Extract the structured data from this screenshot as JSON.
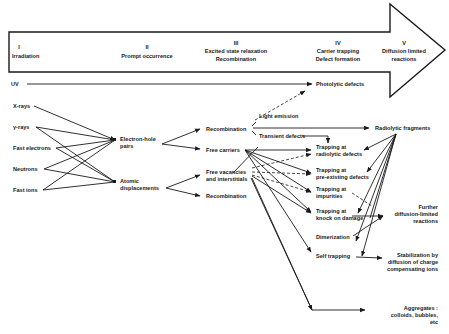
{
  "stages": [
    {
      "num": "I",
      "label": "Irradiation",
      "label2": ""
    },
    {
      "num": "II",
      "label": "Prompt occurrence",
      "label2": ""
    },
    {
      "num": "III",
      "label": "Excited state relaxation",
      "label2": "Recombination"
    },
    {
      "num": "IV",
      "label": "Carrier trapping",
      "label2": "Defect formation"
    },
    {
      "num": "V",
      "label": "Diffusion limited",
      "label2": "reactions"
    }
  ],
  "sources": {
    "uv": "UV",
    "xrays": "X-rays",
    "gamma": "γ-rays",
    "fast_electrons": "Fast electrons",
    "neutrons": "Neutrons",
    "fast_ions": "Fast ions"
  },
  "primary": {
    "eh_pairs_1": "Electron-hole",
    "eh_pairs_2": "pairs",
    "atomic_1": "Atomic",
    "atomic_2": "displacements"
  },
  "relaxation": {
    "recombination": "Recombination",
    "free_carriers": "Free carriers",
    "free_vac_1": "Free vacancies",
    "free_vac_2": "and interstitials",
    "recombination2": "Recombination",
    "light_emission": "Light emission",
    "transient_defects": "Transient defects"
  },
  "trapping": {
    "photolytic": "Photolytic defects",
    "t1a": "Trapping at",
    "t1b": "radiolytic defects",
    "t2a": "Trapping at",
    "t2b": "pre-existing defects",
    "t3a": "Trapping at",
    "t3b": "impurities",
    "t4a": "Trapping at",
    "t4b": "knock on damage",
    "dimerization": "Dimerization",
    "self_trapping": "Self trapping"
  },
  "outcomes": {
    "radiolytic_fragments": "Radiolytic fragments",
    "further_1": "Further",
    "further_2": "diffusion-limited",
    "further_3": "reactions",
    "stab_1": "Stabilization by",
    "stab_2": "diffusion of charge",
    "stab_3": "compensating ions",
    "agg_1": "Aggregates :",
    "agg_2": "colloids, bubbles,",
    "agg_3": "etc"
  }
}
